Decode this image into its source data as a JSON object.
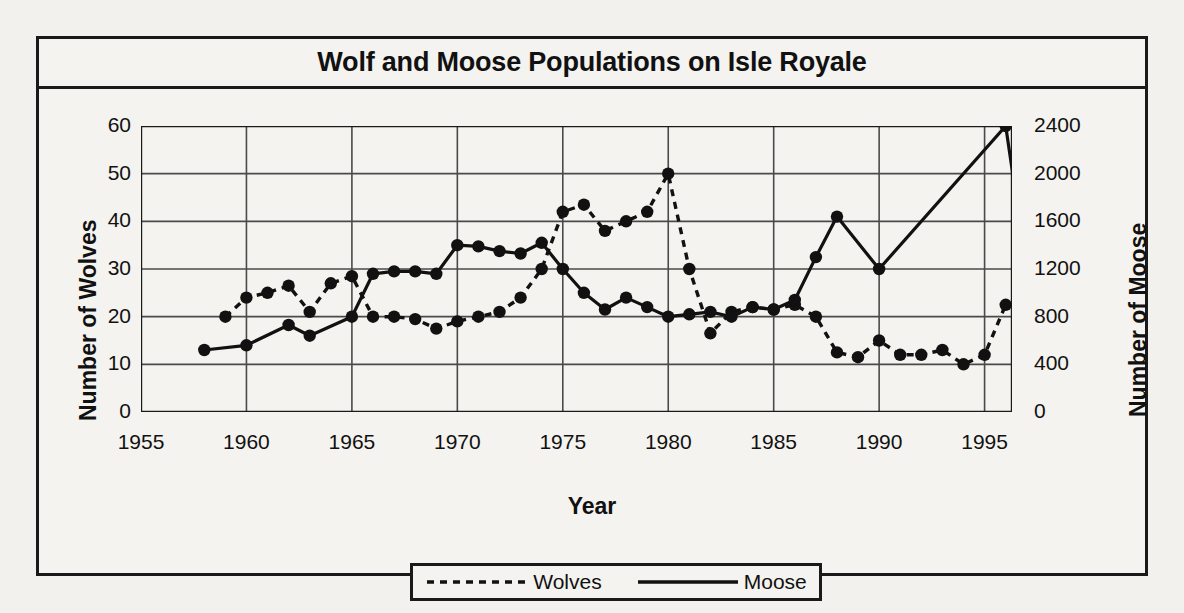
{
  "figure": {
    "title": "Wolf and Moose Populations on Isle Royale"
  },
  "axes": {
    "xlabel": "Year",
    "ylabel_left": "Number of Wolves",
    "ylabel_right": "Number of Moose",
    "xticks": [
      "1955",
      "1960",
      "1965",
      "1970",
      "1975",
      "1980",
      "1985",
      "1990",
      "1995"
    ],
    "yticks_left": [
      "60",
      "50",
      "40",
      "30",
      "20",
      "10",
      "0"
    ],
    "yticks_right": [
      "2400",
      "2000",
      "1600",
      "1200",
      "800",
      "400",
      "0"
    ]
  },
  "legend": {
    "items": [
      {
        "label": "Wolves",
        "style": "dashed"
      },
      {
        "label": "Moose",
        "style": "solid"
      }
    ]
  },
  "chart_data": {
    "type": "line",
    "title": "Wolf and Moose Populations on Isle Royale",
    "xlabel": "Year",
    "ylabel": "Number of Wolves",
    "ylabel_secondary": "Number of Moose",
    "xlim": [
      1955,
      1996.3
    ],
    "ylim": [
      0,
      60
    ],
    "ylim_secondary": [
      0,
      2400
    ],
    "xticks": [
      1955,
      1960,
      1965,
      1970,
      1975,
      1980,
      1985,
      1990,
      1995
    ],
    "yticks": [
      0,
      10,
      20,
      30,
      40,
      50,
      60
    ],
    "yticks_secondary": [
      0,
      400,
      800,
      1200,
      1600,
      2000,
      2400
    ],
    "grid": true,
    "legend_position": "below",
    "markers": "filled-circle",
    "series": [
      {
        "name": "Wolves",
        "axis": "left",
        "units": "wolves",
        "linestyle": "dashed",
        "color": "#111111",
        "points": [
          {
            "x": 1959,
            "y": 20
          },
          {
            "x": 1960,
            "y": 24
          },
          {
            "x": 1961,
            "y": 25
          },
          {
            "x": 1962,
            "y": 26.5
          },
          {
            "x": 1963,
            "y": 21
          },
          {
            "x": 1964,
            "y": 27
          },
          {
            "x": 1965,
            "y": 28.5
          },
          {
            "x": 1966,
            "y": 20
          },
          {
            "x": 1967,
            "y": 20
          },
          {
            "x": 1968,
            "y": 19.5
          },
          {
            "x": 1969,
            "y": 17.5
          },
          {
            "x": 1970,
            "y": 19
          },
          {
            "x": 1971,
            "y": 20
          },
          {
            "x": 1972,
            "y": 21
          },
          {
            "x": 1973,
            "y": 24
          },
          {
            "x": 1974,
            "y": 30
          },
          {
            "x": 1975,
            "y": 42
          },
          {
            "x": 1976,
            "y": 43.5
          },
          {
            "x": 1977,
            "y": 38
          },
          {
            "x": 1978,
            "y": 40
          },
          {
            "x": 1979,
            "y": 42
          },
          {
            "x": 1980,
            "y": 50
          },
          {
            "x": 1981,
            "y": 30
          },
          {
            "x": 1982,
            "y": 16.5
          },
          {
            "x": 1983,
            "y": 21
          },
          {
            "x": 1984,
            "y": 22
          },
          {
            "x": 1985,
            "y": 21.5
          },
          {
            "x": 1986,
            "y": 22.5
          },
          {
            "x": 1987,
            "y": 20
          },
          {
            "x": 1988,
            "y": 12.5
          },
          {
            "x": 1989,
            "y": 11.5
          },
          {
            "x": 1990,
            "y": 15
          },
          {
            "x": 1991,
            "y": 12
          },
          {
            "x": 1992,
            "y": 12
          },
          {
            "x": 1993,
            "y": 13
          },
          {
            "x": 1994,
            "y": 10
          },
          {
            "x": 1995,
            "y": 12
          },
          {
            "x": 1996,
            "y": 22.5
          }
        ]
      },
      {
        "name": "Moose",
        "axis": "right",
        "units": "moose",
        "linestyle": "solid",
        "color": "#111111",
        "points": [
          {
            "x": 1958,
            "y": 520
          },
          {
            "x": 1960,
            "y": 560
          },
          {
            "x": 1962,
            "y": 730
          },
          {
            "x": 1963,
            "y": 640
          },
          {
            "x": 1965,
            "y": 800
          },
          {
            "x": 1966,
            "y": 1160
          },
          {
            "x": 1967,
            "y": 1180
          },
          {
            "x": 1968,
            "y": 1180
          },
          {
            "x": 1969,
            "y": 1160
          },
          {
            "x": 1970,
            "y": 1400
          },
          {
            "x": 1971,
            "y": 1390
          },
          {
            "x": 1972,
            "y": 1350
          },
          {
            "x": 1973,
            "y": 1330
          },
          {
            "x": 1974,
            "y": 1420
          },
          {
            "x": 1975,
            "y": 1200
          },
          {
            "x": 1976,
            "y": 1000
          },
          {
            "x": 1977,
            "y": 860
          },
          {
            "x": 1978,
            "y": 960
          },
          {
            "x": 1979,
            "y": 880
          },
          {
            "x": 1980,
            "y": 800
          },
          {
            "x": 1981,
            "y": 820
          },
          {
            "x": 1982,
            "y": 840
          },
          {
            "x": 1983,
            "y": 800
          },
          {
            "x": 1984,
            "y": 880
          },
          {
            "x": 1985,
            "y": 860
          },
          {
            "x": 1986,
            "y": 940
          },
          {
            "x": 1987,
            "y": 1300
          },
          {
            "x": 1988,
            "y": 1640
          },
          {
            "x": 1990,
            "y": 1200
          },
          {
            "x": 1996,
            "y": 2400
          },
          {
            "x": 1997,
            "y": 1200
          }
        ]
      }
    ]
  }
}
